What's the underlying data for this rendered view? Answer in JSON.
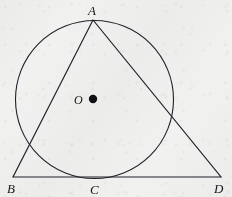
{
  "figure": {
    "background_color": "#f1f1f0",
    "stroke_color": "#20202a",
    "canvas": {
      "width": 232,
      "height": 197
    }
  },
  "labels": {
    "apex": "A",
    "left_base": "B",
    "tangent_point": "C",
    "right_base": "D",
    "center": "O"
  },
  "points": {
    "A": {
      "x": 93,
      "y": 20
    },
    "B": {
      "x": 13,
      "y": 177
    },
    "C": {
      "x": 95,
      "y": 177
    },
    "D": {
      "x": 221,
      "y": 177
    },
    "O": {
      "x": 94.5,
      "y": 99.5
    }
  },
  "circle": {
    "cx": 94.5,
    "cy": 99.5,
    "r": 79,
    "stroke_width": 1.1
  },
  "center_dot": {
    "cx": 93,
    "cy": 99,
    "r": 4.2,
    "fill": "#101014"
  },
  "segments": [
    {
      "name": "AB",
      "from": "A",
      "to": "B"
    },
    {
      "name": "BD",
      "from": "B",
      "to": "D"
    },
    {
      "name": "AD",
      "from": "A",
      "to": "D"
    }
  ]
}
